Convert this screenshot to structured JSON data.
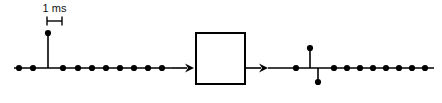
{
  "figure": {
    "background_color": "#ffffff",
    "stroke_color": "#000000",
    "sample_dot_color": "#000000",
    "baseline_color": "#000000"
  },
  "scale_marker": {
    "label": "1 ms",
    "name": "sample-spacing-marker",
    "x_start": 47,
    "x_end": 62,
    "y": 21,
    "cap_height": 9
  },
  "input_signal": {
    "name": "input-impulse-signal",
    "baseline_y": 68,
    "baseline_x_start": 14,
    "baseline_x_end": 172,
    "sample_spacing": 15,
    "dot_radius": 3.1,
    "impulse": {
      "x": 48,
      "amplitude_y": 33,
      "value_label": ""
    },
    "samples": [
      {
        "x": 19,
        "y": 68,
        "value": 0
      },
      {
        "x": 33,
        "y": 68,
        "value": 0
      },
      {
        "x": 48,
        "y": 33,
        "value": 1
      },
      {
        "x": 63,
        "y": 68,
        "value": 0
      },
      {
        "x": 78,
        "y": 68,
        "value": 0
      },
      {
        "x": 92,
        "y": 68,
        "value": 0
      },
      {
        "x": 106,
        "y": 68,
        "value": 0
      },
      {
        "x": 120,
        "y": 68,
        "value": 0
      },
      {
        "x": 134,
        "y": 68,
        "value": 0
      },
      {
        "x": 148,
        "y": 68,
        "value": 0
      },
      {
        "x": 162,
        "y": 68,
        "value": 0
      }
    ]
  },
  "input_arrow": {
    "name": "input-arrow",
    "x_start": 172,
    "x_end": 194,
    "y": 68
  },
  "system_block": {
    "name": "system-block",
    "label": "",
    "x": 196,
    "y": 33,
    "width": 49,
    "height": 51,
    "border_color": "#000000",
    "fill_color": "#ffffff",
    "border_width": 2
  },
  "output_arrow": {
    "name": "output-arrow",
    "x_start": 245,
    "x_end": 268,
    "y": 68
  },
  "output_signal": {
    "name": "output-doublet-signal",
    "baseline_y": 68,
    "baseline_x_start": 268,
    "baseline_x_end": 434,
    "sample_spacing": 14,
    "dot_radius": 3.1,
    "impulse_up": {
      "x": 310,
      "amplitude_y": 48,
      "value": 1
    },
    "impulse_down": {
      "x": 318,
      "amplitude_y": 82,
      "value": -1
    },
    "samples": [
      {
        "x": 296,
        "y": 68,
        "value": 0
      },
      {
        "x": 310,
        "y": 48,
        "value": 1
      },
      {
        "x": 318,
        "y": 82,
        "value": -1
      },
      {
        "x": 334,
        "y": 68,
        "value": 0
      },
      {
        "x": 347,
        "y": 68,
        "value": 0
      },
      {
        "x": 360,
        "y": 68,
        "value": 0
      },
      {
        "x": 373,
        "y": 68,
        "value": 0
      },
      {
        "x": 386,
        "y": 68,
        "value": 0
      },
      {
        "x": 399,
        "y": 68,
        "value": 0
      },
      {
        "x": 412,
        "y": 68,
        "value": 0
      },
      {
        "x": 425,
        "y": 68,
        "value": 0
      }
    ]
  }
}
